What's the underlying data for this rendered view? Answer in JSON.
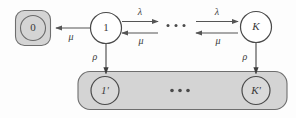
{
  "diagram": {
    "kind": "markov-state-transition-diagram",
    "background_color": "#fdfdfd",
    "group_fill_color": "#d4d4d4",
    "group_stroke_color": "#6e6e6e",
    "node_fill_color": "#ffffff",
    "node_stroke_color": "#4a4a4a",
    "arrow_color": "#555555",
    "text_color": "#3a3a3a",
    "states": {
      "zero": {
        "label": "0",
        "italic": false,
        "grouped": true,
        "group_shape": "rounded-square"
      },
      "one": {
        "label": "1",
        "italic": false,
        "grouped": false
      },
      "k": {
        "label": "K",
        "italic": true,
        "grouped": false
      },
      "one_prime": {
        "label": "1'",
        "italic": true,
        "grouped": true
      },
      "k_prime": {
        "label": "K'",
        "italic": true,
        "grouped": true
      }
    },
    "ellipsis": {
      "top_label": "...",
      "bottom_label": "...",
      "dot_count": 3
    },
    "transitions": [
      {
        "id": "one-to-zero",
        "rate_label": "μ",
        "rate_name": "mu",
        "direction": "left",
        "from": "1",
        "to": "0"
      },
      {
        "id": "one-to-mid-forward",
        "rate_label": "λ",
        "rate_name": "lambda",
        "direction": "right",
        "from": "1",
        "to": "..."
      },
      {
        "id": "mid-to-one-backward",
        "rate_label": "μ",
        "rate_name": "mu",
        "direction": "left",
        "from": "...",
        "to": "1"
      },
      {
        "id": "mid-to-k-forward",
        "rate_label": "λ",
        "rate_name": "lambda",
        "direction": "right",
        "from": "...",
        "to": "K"
      },
      {
        "id": "k-to-mid-backward",
        "rate_label": "μ",
        "rate_name": "mu",
        "direction": "left",
        "from": "K",
        "to": "..."
      },
      {
        "id": "one-to-one-prime",
        "rate_label": "ρ",
        "rate_name": "rho",
        "direction": "down",
        "from": "1",
        "to": "1'"
      },
      {
        "id": "k-to-k-prime",
        "rate_label": "ρ",
        "rate_name": "rho",
        "direction": "down",
        "from": "K",
        "to": "K'"
      }
    ]
  }
}
